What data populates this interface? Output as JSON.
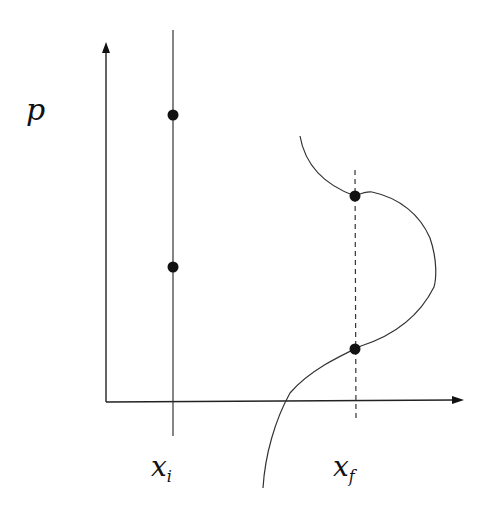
{
  "diagram": {
    "type": "phase-space sketch",
    "axes": {
      "y_label": "p",
      "x_axis_arrow": true,
      "y_axis_arrow": true
    },
    "labels": {
      "xi_main": "x",
      "xi_sub": "i",
      "xf_main": "x",
      "xf_sub": "f",
      "p": "p"
    },
    "lines": [
      {
        "name": "x_i",
        "style": "solid",
        "x": 173
      },
      {
        "name": "x_f",
        "style": "dashed",
        "x": 355
      }
    ],
    "points": [
      {
        "on": "x_i",
        "y": 115
      },
      {
        "on": "x_i",
        "y": 267
      },
      {
        "on": "x_f",
        "y": 196
      },
      {
        "on": "x_f",
        "y": 349
      }
    ],
    "curve": "S-shaped curve crossing x_f line at two points",
    "colors": {
      "ink": "#111111",
      "background": "#ffffff"
    }
  }
}
